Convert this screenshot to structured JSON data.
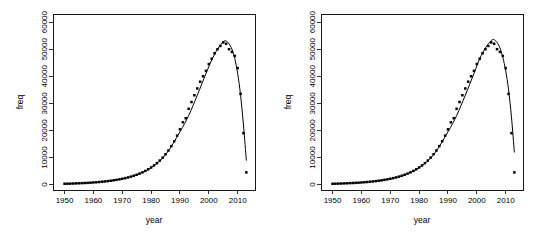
{
  "figure": {
    "panel_count": 2,
    "background": "#ffffff",
    "foreground": "#000000"
  },
  "chart_data": [
    {
      "type": "scatter",
      "title": "",
      "subtitle": "",
      "xlabel": "year",
      "ylabel": "freq",
      "xlim": [
        1946,
        2016
      ],
      "ylim": [
        -2000,
        63000
      ],
      "xticks": [
        1950,
        1960,
        1970,
        1980,
        1990,
        2000,
        2010
      ],
      "xticklabels": [
        "1950",
        "1960",
        "1970",
        "1980",
        "1990",
        "2000",
        "2010"
      ],
      "yticks": [
        0,
        10000,
        20000,
        30000,
        40000,
        50000,
        60000
      ],
      "yticklabels": [
        "0",
        "10000",
        "20000",
        "30000",
        "40000",
        "50000",
        "60000"
      ],
      "grid": false,
      "legend": null,
      "legend_position": "none",
      "marker": "filled-square",
      "series": [
        {
          "name": "observed freq",
          "kind": "points",
          "x": [
            1950,
            1951,
            1952,
            1953,
            1954,
            1955,
            1956,
            1957,
            1958,
            1959,
            1960,
            1961,
            1962,
            1963,
            1964,
            1965,
            1966,
            1967,
            1968,
            1969,
            1970,
            1971,
            1972,
            1973,
            1974,
            1975,
            1976,
            1977,
            1978,
            1979,
            1980,
            1981,
            1982,
            1983,
            1984,
            1985,
            1986,
            1987,
            1988,
            1989,
            1990,
            1991,
            1992,
            1993,
            1994,
            1995,
            1996,
            1997,
            1998,
            1999,
            2000,
            2001,
            2002,
            2003,
            2004,
            2005,
            2006,
            2007,
            2008,
            2009,
            2010,
            2011,
            2012,
            2013
          ],
          "values": [
            300,
            330,
            360,
            400,
            440,
            480,
            530,
            580,
            640,
            700,
            780,
            860,
            950,
            1050,
            1160,
            1280,
            1420,
            1570,
            1740,
            1930,
            2140,
            2380,
            2640,
            2940,
            3270,
            3640,
            4060,
            4530,
            5060,
            5650,
            6320,
            7070,
            7920,
            8880,
            9960,
            11200,
            12600,
            14200,
            16000,
            18100,
            20400,
            23000,
            24500,
            28000,
            30500,
            33000,
            35500,
            38000,
            40000,
            42000,
            44500,
            46500,
            48500,
            50000,
            51200,
            52500,
            52000,
            50000,
            49000,
            47500,
            43000,
            33500,
            19000,
            4500
          ]
        },
        {
          "name": "fitted curve",
          "kind": "line",
          "x": [
            1950,
            1955,
            1960,
            1965,
            1970,
            1975,
            1980,
            1985,
            1990,
            1993,
            1996,
            1999,
            2001,
            2003,
            2005,
            2006,
            2007,
            2008,
            2009,
            2010,
            2011,
            2012,
            2013
          ],
          "values": [
            250,
            450,
            780,
            1300,
            2150,
            3600,
            6200,
            11000,
            19500,
            25500,
            33000,
            41000,
            46000,
            50000,
            52800,
            53000,
            52000,
            50000,
            46500,
            41000,
            33000,
            22000,
            9000
          ]
        }
      ],
      "annotations": [
        {
          "note": "final observation falls far below fitted curve",
          "x": 2013,
          "y": 4500
        }
      ]
    },
    {
      "type": "scatter",
      "title": "",
      "subtitle": "",
      "xlabel": "year",
      "ylabel": "freq",
      "xlim": [
        1946,
        2016
      ],
      "ylim": [
        -2000,
        63000
      ],
      "xticks": [
        1950,
        1960,
        1970,
        1980,
        1990,
        2000,
        2010
      ],
      "xticklabels": [
        "1950",
        "1960",
        "1970",
        "1980",
        "1990",
        "2000",
        "2010"
      ],
      "yticks": [
        0,
        10000,
        20000,
        30000,
        40000,
        50000,
        60000
      ],
      "yticklabels": [
        "0",
        "10000",
        "20000",
        "30000",
        "40000",
        "50000",
        "60000"
      ],
      "grid": false,
      "legend": null,
      "legend_position": "none",
      "marker": "filled-square",
      "series": [
        {
          "name": "observed freq",
          "kind": "points",
          "x": [
            1950,
            1951,
            1952,
            1953,
            1954,
            1955,
            1956,
            1957,
            1958,
            1959,
            1960,
            1961,
            1962,
            1963,
            1964,
            1965,
            1966,
            1967,
            1968,
            1969,
            1970,
            1971,
            1972,
            1973,
            1974,
            1975,
            1976,
            1977,
            1978,
            1979,
            1980,
            1981,
            1982,
            1983,
            1984,
            1985,
            1986,
            1987,
            1988,
            1989,
            1990,
            1991,
            1992,
            1993,
            1994,
            1995,
            1996,
            1997,
            1998,
            1999,
            2000,
            2001,
            2002,
            2003,
            2004,
            2005,
            2006,
            2007,
            2008,
            2009,
            2010,
            2011,
            2012,
            2013
          ],
          "values": [
            300,
            330,
            360,
            400,
            440,
            480,
            530,
            580,
            640,
            700,
            780,
            860,
            950,
            1050,
            1160,
            1280,
            1420,
            1570,
            1740,
            1930,
            2140,
            2380,
            2640,
            2940,
            3270,
            3640,
            4060,
            4530,
            5060,
            5650,
            6320,
            7070,
            7920,
            8880,
            9960,
            11200,
            12600,
            14200,
            16000,
            18100,
            20400,
            23000,
            24500,
            28000,
            30500,
            33000,
            35500,
            38000,
            40000,
            42000,
            44500,
            46500,
            48500,
            50000,
            51200,
            52500,
            52000,
            50000,
            49000,
            47500,
            43000,
            33500,
            19000,
            4500
          ]
        },
        {
          "name": "fitted curve",
          "kind": "line",
          "x": [
            1950,
            1955,
            1960,
            1965,
            1970,
            1975,
            1980,
            1985,
            1990,
            1993,
            1996,
            1999,
            2001,
            2003,
            2005,
            2006,
            2007,
            2008,
            2009,
            2010,
            2011,
            2012,
            2013
          ],
          "values": [
            250,
            450,
            780,
            1300,
            2150,
            3600,
            6200,
            11000,
            19500,
            25500,
            33000,
            41000,
            46500,
            50500,
            53200,
            53500,
            52500,
            50500,
            47000,
            42000,
            35000,
            25000,
            12000
          ]
        }
      ],
      "annotations": [
        {
          "note": "final observation falls far below fitted curve",
          "x": 2013,
          "y": 4500
        }
      ]
    }
  ]
}
